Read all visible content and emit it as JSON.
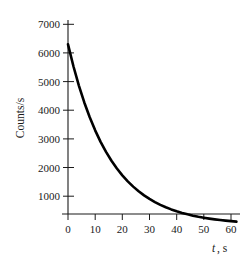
{
  "chart_data": {
    "type": "line",
    "title": "",
    "subtitle": "",
    "xlabel": "t, s",
    "xlabel_symbol": "t",
    "xlabel_unit": ", s",
    "ylabel": "Counts/s",
    "xlim": [
      0,
      62
    ],
    "ylim": [
      0,
      7400
    ],
    "grid": false,
    "legend": null,
    "x_ticks": [
      0,
      10,
      20,
      30,
      40,
      50,
      60
    ],
    "x_tick_labels": [
      "0",
      "10",
      "20",
      "30",
      "40",
      "50",
      "60"
    ],
    "y_ticks": [
      1000,
      2000,
      3000,
      4000,
      5000,
      6000,
      7000
    ],
    "y_tick_labels": [
      "1000",
      "2000",
      "3000",
      "4000",
      "5000",
      "6000",
      "7000"
    ],
    "series": [
      {
        "name": "Counts/s decay",
        "curve": "exponential-decay",
        "x": [
          0,
          2,
          4,
          6,
          8,
          10,
          12,
          14,
          16,
          18,
          20,
          22,
          24,
          26,
          28,
          30,
          32,
          34,
          36,
          38,
          40,
          42,
          44,
          46,
          48,
          50,
          52,
          54,
          56,
          58,
          60,
          62
        ],
        "values": [
          6300,
          5535,
          4863,
          4273,
          3754,
          3299,
          2898,
          2547,
          2238,
          1966,
          1727,
          1518,
          1334,
          1172,
          1029,
          905,
          795,
          698,
          614,
          539,
          474,
          416,
          366,
          321,
          282,
          248,
          218,
          192,
          169,
          148,
          130,
          114
        ]
      }
    ]
  },
  "axes": {
    "x_axis_name": "time-axis",
    "y_axis_name": "counts-axis"
  }
}
